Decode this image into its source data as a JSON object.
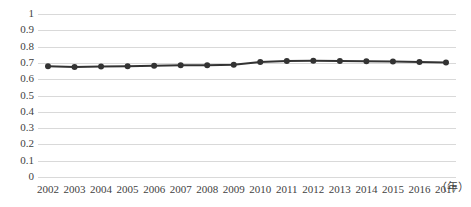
{
  "chart_data": {
    "type": "line",
    "title": "",
    "xlabel": "（年）",
    "ylabel": "",
    "x": [
      2002,
      2003,
      2004,
      2005,
      2006,
      2007,
      2008,
      2009,
      2010,
      2011,
      2012,
      2013,
      2014,
      2015,
      2016,
      2017
    ],
    "categories": [
      "2002",
      "2003",
      "2004",
      "2005",
      "2006",
      "2007",
      "2008",
      "2009",
      "2010",
      "2011",
      "2012",
      "2013",
      "2014",
      "2015",
      "2016",
      "2017"
    ],
    "values": [
      0.68,
      0.675,
      0.678,
      0.68,
      0.683,
      0.685,
      0.685,
      0.688,
      0.705,
      0.712,
      0.713,
      0.712,
      0.71,
      0.708,
      0.705,
      0.702
    ],
    "series": [
      {
        "name": "",
        "values": [
          0.68,
          0.675,
          0.678,
          0.68,
          0.683,
          0.685,
          0.685,
          0.688,
          0.705,
          0.712,
          0.713,
          0.712,
          0.71,
          0.708,
          0.705,
          0.702
        ]
      }
    ],
    "ylim": [
      0,
      1
    ],
    "yticks": [
      0,
      0.1,
      0.2,
      0.3,
      0.4,
      0.5,
      0.6,
      0.7,
      0.8,
      0.9,
      1
    ],
    "ytick_labels": [
      "0",
      "0.1",
      "0.2",
      "0.3",
      "0.4",
      "0.5",
      "0.6",
      "0.7",
      "0.8",
      "0.9",
      "1"
    ],
    "grid": "horizontal",
    "legend": "none",
    "line_color": "#333333",
    "marker": "circle",
    "marker_color": "#333333",
    "gridline_color": "#d9d9d9"
  }
}
